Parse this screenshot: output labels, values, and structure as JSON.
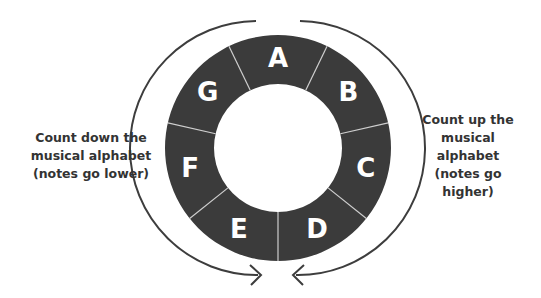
{
  "diagram": {
    "type": "circular-musical-alphabet",
    "notes": [
      "A",
      "B",
      "C",
      "D",
      "E",
      "F",
      "G"
    ],
    "colors": {
      "ring": "#3b3b3b",
      "divider": "#cfcfcf",
      "letter": "#ffffff",
      "arrow": "#3d3d3d",
      "caption": "#333333"
    },
    "left_caption": "Count down the\nmusical alphabet\n(notes go lower)",
    "right_caption": "Count up the\nmusical alphabet\n(notes go higher)",
    "arrows": [
      {
        "name": "down-arrow",
        "direction": "counterclockwise",
        "meaning": "notes go lower"
      },
      {
        "name": "up-arrow",
        "direction": "clockwise",
        "meaning": "notes go higher"
      }
    ]
  }
}
